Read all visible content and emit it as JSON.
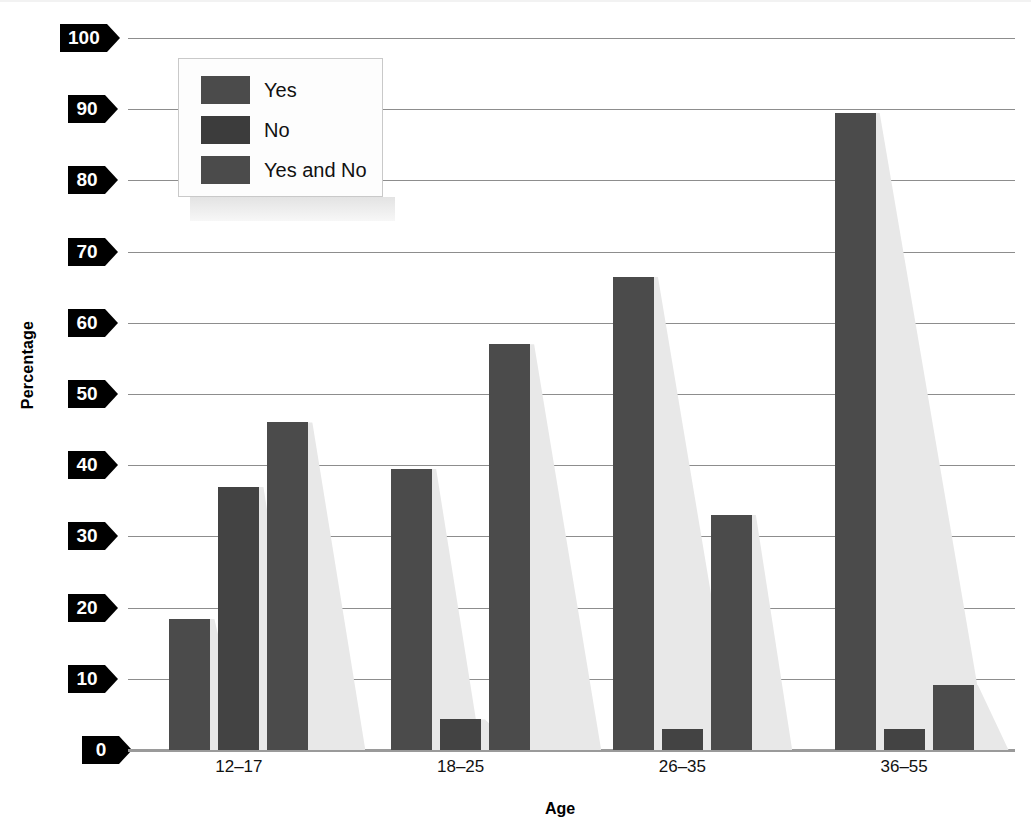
{
  "chart_data": {
    "type": "bar",
    "title": "",
    "xlabel": "Age",
    "ylabel": "Percentage",
    "categories": [
      "12–17",
      "18–25",
      "26–35",
      "36–55"
    ],
    "series": [
      {
        "name": "Yes",
        "values": [
          18.4,
          39.5,
          66.5,
          89.5
        ]
      },
      {
        "name": "No",
        "values": [
          37.0,
          4.3,
          2.9,
          2.9
        ]
      },
      {
        "name": "Yes and No",
        "values": [
          46.0,
          57.0,
          33.0,
          9.2
        ]
      }
    ],
    "ylim": [
      0,
      100
    ],
    "ytick_labels": [
      "100",
      "90",
      "80",
      "70",
      "60",
      "50",
      "40",
      "30",
      "20",
      "10",
      "0"
    ],
    "ytick_values": [
      100,
      90,
      80,
      70,
      60,
      50,
      40,
      30,
      20,
      10,
      0
    ],
    "grid": true,
    "legend_position": "upper-left-inside",
    "bar_color": "#4b4b4b",
    "bar_shadow_color": "#e8e8e8",
    "gridline_color": "#8d8d8d",
    "tick_box_color": "#000000",
    "tick_text_color": "#ffffff"
  },
  "legend": {
    "entries": [
      {
        "label": "Yes"
      },
      {
        "label": "No"
      },
      {
        "label": "Yes and No"
      }
    ]
  },
  "axes": {
    "y_title": "Percentage",
    "x_title": "Age"
  }
}
